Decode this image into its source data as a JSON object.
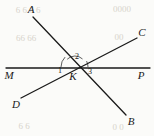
{
  "figure": {
    "width": 154,
    "height": 136,
    "background_color": "#fbfbf9",
    "stroke_color": "#1a1a1a",
    "caption": "Three lines meeting at point K"
  },
  "chart_data": {
    "type": "diagram",
    "title": "",
    "intersection": {
      "name": "K",
      "x": 75,
      "y": 67
    },
    "lines": [
      {
        "name": "line-MP",
        "from_label": "M",
        "to_label": "P",
        "x1": 6,
        "y1": 68,
        "x2": 150,
        "y2": 68
      },
      {
        "name": "line-AB",
        "from_label": "A",
        "to_label": "B",
        "x1": 33,
        "y1": 17,
        "x2": 126,
        "y2": 115
      },
      {
        "name": "line-DC",
        "from_label": "D",
        "to_label": "C",
        "x1": 21,
        "y1": 98,
        "x2": 137,
        "y2": 38
      }
    ],
    "point_labels": [
      {
        "id": "A",
        "text": "A",
        "x": 31,
        "y": 9
      },
      {
        "id": "C",
        "text": "C",
        "x": 142,
        "y": 32
      },
      {
        "id": "M",
        "text": "M",
        "x": 9,
        "y": 75
      },
      {
        "id": "P",
        "text": "P",
        "x": 141,
        "y": 75
      },
      {
        "id": "K",
        "text": "K",
        "x": 73,
        "y": 76
      },
      {
        "id": "D",
        "text": "D",
        "x": 16,
        "y": 104
      },
      {
        "id": "B",
        "text": "B",
        "x": 131,
        "y": 121
      }
    ],
    "angle_labels": [
      {
        "id": "1",
        "text": "1",
        "x": 60,
        "y": 71
      },
      {
        "id": "2",
        "text": "2",
        "x": 77,
        "y": 57
      },
      {
        "id": "3",
        "text": "3",
        "x": 90,
        "y": 72
      }
    ],
    "angle_arcs": [
      {
        "id": "arc-1",
        "cx": 75,
        "cy": 67,
        "r": 14,
        "start_deg": 180,
        "end_deg": 225
      },
      {
        "id": "arc-2",
        "cx": 75,
        "cy": 67,
        "r": 11,
        "start_deg": 225,
        "end_deg": 313
      },
      {
        "id": "arc-3",
        "cx": 75,
        "cy": 67,
        "r": 13,
        "start_deg": 333,
        "end_deg": 360
      }
    ],
    "background_marks": [
      {
        "id": "bleed-1",
        "text": "6 6 6 6",
        "x": 28,
        "y": 10
      },
      {
        "id": "bleed-2",
        "text": "0000",
        "x": 122,
        "y": 9
      },
      {
        "id": "bleed-3",
        "text": "66 66",
        "x": 26,
        "y": 38
      },
      {
        "id": "bleed-4",
        "text": "00",
        "x": 119,
        "y": 37
      },
      {
        "id": "bleed-5",
        "text": "6 6",
        "x": 24,
        "y": 126
      },
      {
        "id": "bleed-6",
        "text": "0 0",
        "x": 118,
        "y": 127
      }
    ]
  }
}
